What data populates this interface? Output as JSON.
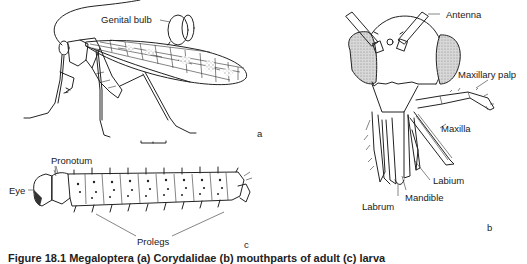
{
  "figure": {
    "panels": [
      {
        "id": "a",
        "letter": "a",
        "subject": "adult-megalopteran-lateral-view",
        "labels": {
          "genital_bulb": "Genital bulb"
        },
        "scale_bar": true
      },
      {
        "id": "b",
        "letter": "b",
        "subject": "head-frontal-view",
        "labels": {
          "antenna": "Antenna",
          "maxillary_palp": "Maxillary palp",
          "maxilla": "Maxilla",
          "labium": "Labium",
          "mandible": "Mandible",
          "labrum": "Labrum"
        }
      },
      {
        "id": "c",
        "letter": "c",
        "subject": "larva-lateral-view",
        "labels": {
          "eye": "Eye",
          "pronotum": "Pronotum",
          "prolegs": "Prolegs"
        }
      }
    ],
    "caption": "Figure 18.1 Megaloptera (a) Corydalidae (b) mouthparts of adult (c) larva"
  }
}
